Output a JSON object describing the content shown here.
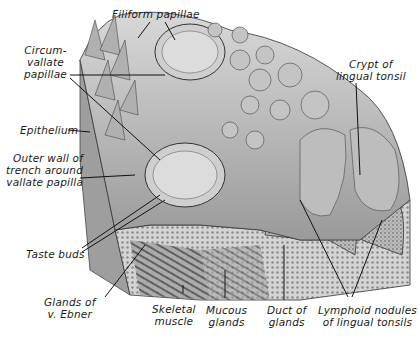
{
  "figure": {
    "type": "anatomical-illustration",
    "labels": {
      "filiform": [
        "Filiform papillae"
      ],
      "circumvallate": [
        "Circum-",
        "vallate",
        "papillae"
      ],
      "epithelium": [
        "Epithelium"
      ],
      "outer_wall": [
        "Outer wall of",
        "trench around",
        "vallate papilla"
      ],
      "taste_buds": [
        "Taste buds"
      ],
      "glands_ebner": [
        "Glands of",
        "v. Ebner"
      ],
      "skeletal": [
        "Skeletal",
        "muscle"
      ],
      "mucous": [
        "Mucous",
        "glands"
      ],
      "duct": [
        "Duct of",
        "glands"
      ],
      "lymphoid": [
        "Lymphoid nodules",
        "of lingual tonsils"
      ],
      "crypt": [
        "Crypt of",
        "lingual tonsil"
      ]
    }
  }
}
